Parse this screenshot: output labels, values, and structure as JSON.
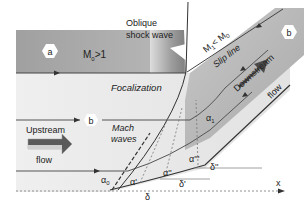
{
  "diagram": {
    "labels": {
      "region_a": "a",
      "region_b": "b",
      "mach_upstream": "M",
      "mach_upstream_sub": "0",
      "mach_upstream_cond": ">1",
      "oblique_line1": "Oblique",
      "oblique_line2": "shock wave",
      "mach_downstream": "M",
      "mach_downstream_sub1": "1",
      "mach_downstream_lt": "< M",
      "mach_downstream_sub0": "0",
      "slip_line": "Slip line",
      "focalization": "Focalization",
      "upstream": "Upstream",
      "upstream_flow": "flow",
      "downstream": "Downstream",
      "downstream_flow": "flow",
      "streamline_b": "b",
      "mach_waves_1": "Mach",
      "mach_waves_2": "waves",
      "alpha0": "α",
      "alpha0_sub": "0",
      "alpha_prime": "α'",
      "alpha_dprime": "α''",
      "alpha_tprime": "α'''",
      "alpha1": "α",
      "alpha1_sub": "1",
      "delta": "δ",
      "delta_prime": "δ'",
      "delta_dprime": "δ''",
      "x_axis": "x"
    },
    "colors": {
      "upstream_band": "#a8a8a8",
      "downstream_band": "#b5b5b5",
      "background_light": "#ececec",
      "arrow_dark": "#555555",
      "line": "#333333"
    }
  }
}
